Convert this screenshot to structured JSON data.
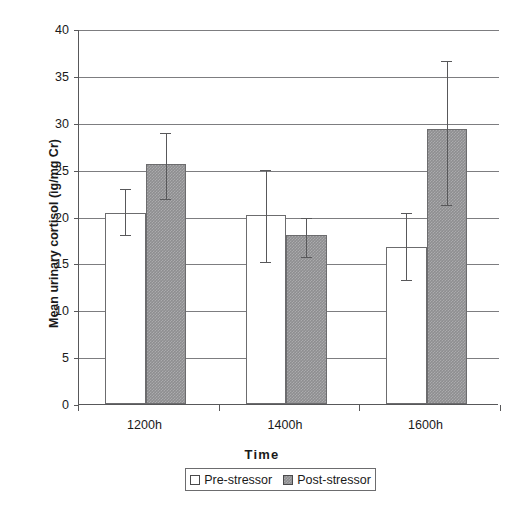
{
  "chart_data": {
    "type": "bar",
    "title": "",
    "subtitle": "",
    "xlabel": "Time",
    "ylabel": "Mean urinary cortisol (ìg/mg Cr)",
    "categories": [
      "1200h",
      "1400h",
      "1600h"
    ],
    "ylim": [
      0,
      40
    ],
    "yticks": [
      0,
      5,
      10,
      15,
      20,
      25,
      30,
      35,
      40
    ],
    "ytick_labels": [
      "0",
      "5",
      "10",
      "15",
      "20",
      "25",
      "30",
      "35",
      "40"
    ],
    "grid": "horizontal",
    "legend_position": "bottom-center",
    "series": [
      {
        "name": "Pre-stressor",
        "color": "#ffffff",
        "values": [
          20.4,
          20.2,
          16.8
        ],
        "error_upper": [
          23.0,
          25.1,
          20.5
        ],
        "error_lower": [
          18.1,
          15.3,
          13.3
        ]
      },
      {
        "name": "Post-stressor",
        "color": "#8e8e90",
        "values": [
          25.6,
          18.0,
          29.3
        ],
        "error_upper": [
          29.0,
          19.9,
          36.7
        ],
        "error_lower": [
          22.0,
          15.8,
          21.3
        ]
      }
    ]
  },
  "legend": {
    "items": [
      {
        "label": "Pre-stressor",
        "swatch": "white-square"
      },
      {
        "label": "Post-stressor",
        "swatch": "gray-square"
      }
    ]
  }
}
